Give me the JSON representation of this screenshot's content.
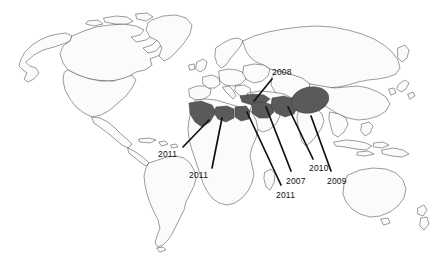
{
  "figure": {
    "kind": "world-map-annotated",
    "background_color": "#ffffff",
    "coastline_color": "#4a4a4a",
    "country_fill_color": "#fbfbfb",
    "highlight_fill_color": "#5a5a5a",
    "leader_line_color": "#111111",
    "label_color": "#111111",
    "width": 448,
    "height": 259
  },
  "annotations": [
    {
      "id": "morocco-western-sahara",
      "year_label": "2011",
      "region_name": "Morocco / Western Sahara",
      "label_x": 158,
      "label_y": 150,
      "leader_from_x": 183,
      "leader_from_y": 147,
      "leader_to_x": 209,
      "leader_to_y": 120
    },
    {
      "id": "libya-algeria",
      "year_label": "2011",
      "region_name": "Libya / Algeria",
      "label_x": 189,
      "label_y": 171,
      "leader_from_x": 212,
      "leader_from_y": 168,
      "leader_to_x": 222,
      "leader_to_y": 118
    },
    {
      "id": "turkey-black-sea",
      "year_label": "2008",
      "region_name": "Turkey",
      "label_x": 272,
      "label_y": 68,
      "leader_from_x": 272,
      "leader_from_y": 79,
      "leader_to_x": 254,
      "leader_to_y": 101
    },
    {
      "id": "egypt-sudan",
      "year_label": "2011",
      "region_name": "Egypt",
      "label_x": 276,
      "label_y": 191,
      "leader_from_x": 281,
      "leader_from_y": 185,
      "leader_to_x": 247,
      "leader_to_y": 112
    },
    {
      "id": "syria-iraq",
      "year_label": "2007",
      "region_name": "Syria / Iraq",
      "label_x": 286,
      "label_y": 177,
      "leader_from_x": 291,
      "leader_from_y": 171,
      "leader_to_x": 266,
      "leader_to_y": 107
    },
    {
      "id": "iran",
      "year_label": "2010",
      "region_name": "Iran",
      "label_x": 309,
      "label_y": 164,
      "leader_from_x": 313,
      "leader_from_y": 159,
      "leader_to_x": 288,
      "leader_to_y": 107
    },
    {
      "id": "central-asia-tibet",
      "year_label": "2009",
      "region_name": "Central Asia / Western China",
      "label_x": 327,
      "label_y": 177,
      "leader_from_x": 331,
      "leader_from_y": 171,
      "leader_to_x": 311,
      "leader_to_y": 116
    }
  ],
  "highlighted_regions": [
    {
      "id": "morocco-western-sahara",
      "year_label": "2011",
      "shape": "polygon"
    },
    {
      "id": "libya-algeria",
      "year_label": "2011",
      "shape": "polygon"
    },
    {
      "id": "egypt",
      "year_label": "2011",
      "shape": "polygon"
    },
    {
      "id": "turkey",
      "year_label": "2008",
      "shape": "polygon"
    },
    {
      "id": "syria-iraq",
      "year_label": "2007",
      "shape": "polygon"
    },
    {
      "id": "iran",
      "year_label": "2010",
      "shape": "polygon"
    },
    {
      "id": "central-asia-tibet",
      "year_label": "2009",
      "shape": "ellipse"
    }
  ]
}
